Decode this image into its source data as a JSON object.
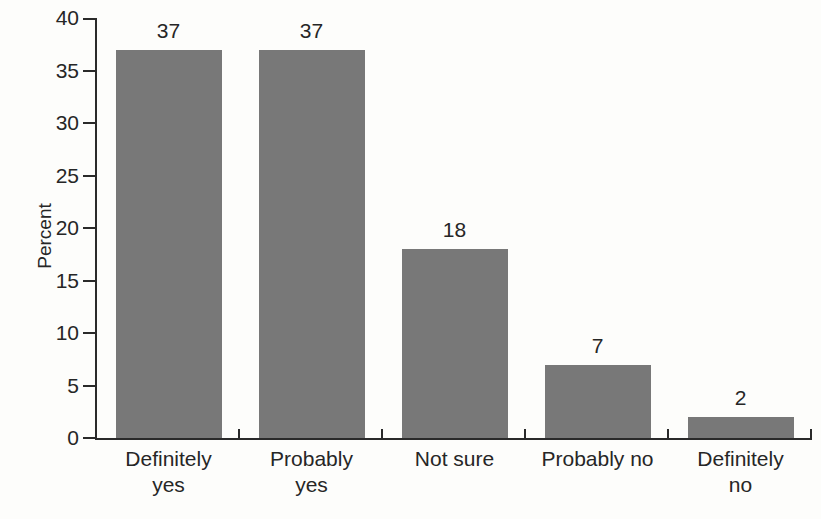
{
  "chart_data": {
    "type": "bar",
    "title": "",
    "xlabel": "",
    "ylabel": "Percent",
    "categories": [
      "Definitely yes",
      "Probably yes",
      "Not sure",
      "Probably no",
      "Definitely no"
    ],
    "category_label_lines": [
      [
        "Definitely",
        "yes"
      ],
      [
        "Probably",
        "yes"
      ],
      [
        "Not sure"
      ],
      [
        "Probably no"
      ],
      [
        "Definitely",
        "no"
      ]
    ],
    "values": [
      37,
      37,
      18,
      7,
      2
    ],
    "value_labels": [
      "37",
      "37",
      "18",
      "7",
      "2"
    ],
    "ylim": [
      0,
      40
    ],
    "yticks": [
      0,
      5,
      10,
      15,
      20,
      25,
      30,
      35,
      40
    ],
    "grid": false,
    "legend_position": "none",
    "bar_color": "#787878",
    "axis_color": "#2a2a2a",
    "text_color": "#262626",
    "background_color": "#fdfdfb"
  }
}
